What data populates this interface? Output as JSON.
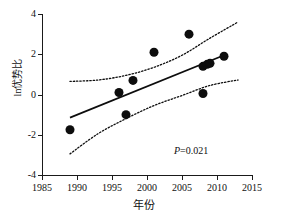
{
  "chart_data": {
    "type": "scatter",
    "title": "",
    "xlabel": "年份",
    "ylabel": "ln优势比",
    "xlim": [
      1985,
      2015
    ],
    "ylim": [
      -4,
      4
    ],
    "xticks": [
      1985,
      1990,
      1995,
      2000,
      2005,
      2010,
      2015
    ],
    "yticks": [
      4,
      2,
      0,
      -2,
      -4
    ],
    "grid": false,
    "legend": null,
    "annotations": [
      {
        "name": "p-value",
        "text_italic": "P",
        "text_rest": "=0.021",
        "full_text": "P=0.021",
        "x": 2008,
        "y": -2.6
      }
    ],
    "points": [
      {
        "x": 1989,
        "y": -1.75
      },
      {
        "x": 1996,
        "y": 0.1
      },
      {
        "x": 1997,
        "y": -1.0
      },
      {
        "x": 1998,
        "y": 0.7
      },
      {
        "x": 2001,
        "y": 2.1
      },
      {
        "x": 2006,
        "y": 3.0
      },
      {
        "x": 2008,
        "y": 0.05
      },
      {
        "x": 2008,
        "y": 1.4
      },
      {
        "x": 2008.6,
        "y": 1.5
      },
      {
        "x": 2009,
        "y": 1.55
      },
      {
        "x": 2011,
        "y": 1.9
      }
    ],
    "point_style": {
      "marker": "circle",
      "color": "#0d0d0d",
      "size_px": 9
    },
    "regression_line": {
      "style": "solid",
      "color": "#0d0d0d",
      "x_start": 1989,
      "y_start": -1.15,
      "x_end": 2011,
      "y_end": 1.95
    },
    "confidence_band_upper": {
      "style": "dotted",
      "color": "#0d0d0d",
      "x": [
        1989,
        1993,
        1997,
        2001,
        2005,
        2009,
        2013
      ],
      "y": [
        0.65,
        0.72,
        0.95,
        1.35,
        1.95,
        2.8,
        3.6
      ]
    },
    "confidence_band_lower": {
      "style": "dotted",
      "color": "#0d0d0d",
      "x": [
        1989,
        1993,
        1997,
        2001,
        2005,
        2009,
        2013
      ],
      "y": [
        -2.95,
        -1.95,
        -1.2,
        -0.55,
        -0.05,
        0.45,
        0.72
      ]
    }
  },
  "axis": {
    "x_tick_labels": [
      "1985",
      "1990",
      "1995",
      "2000",
      "2005",
      "2010",
      "2015"
    ],
    "y_tick_labels": [
      "4",
      "2",
      "0",
      "-2",
      "-4"
    ],
    "x_axis_title": "年份",
    "y_axis_title": "ln优势比"
  },
  "colors": {
    "axis": "#1a1a1a",
    "marker": "#0d0d0d",
    "line": "#0d0d0d",
    "background": "#ffffff"
  }
}
